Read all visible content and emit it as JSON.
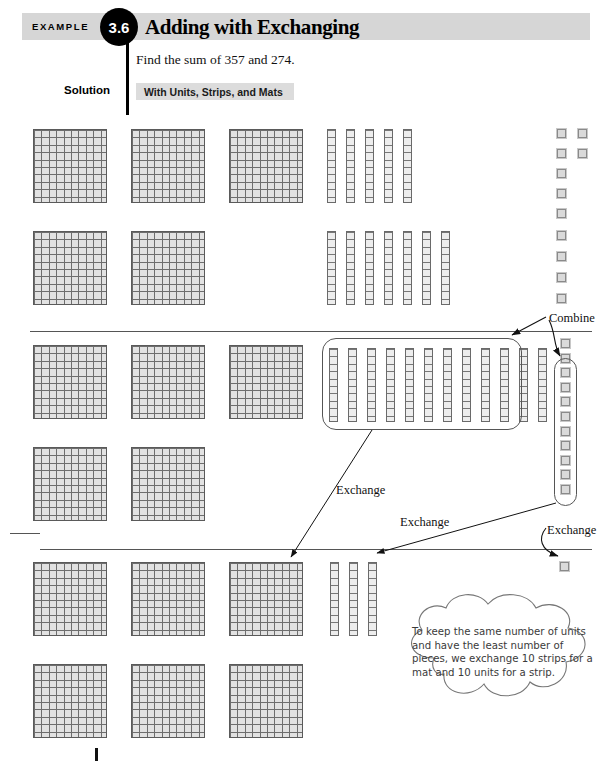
{
  "header": {
    "example_label": "EXAMPLE",
    "example_number": "3.6",
    "title": "Adding with Exchanging"
  },
  "problem": {
    "statement": "Find the sum of 357 and 274.",
    "solution_label": "Solution",
    "method_label": "With Units, Strips, and Mats"
  },
  "annotations": {
    "combine": "Combine",
    "exchange_strips": "Exchange",
    "exchange_units": "Exchange",
    "exchange_single": "Exchange"
  },
  "callout": {
    "text": "To keep the same number of units and have the least number of pieces, we exchange 10 strips for a mat and 10 units for a strip."
  },
  "colors": {
    "header_band": "#d6d6d6",
    "badge": "#000000",
    "mat_fill": "#e2e2e2",
    "mat_grid": "#6e6e6e",
    "unit_fill": "#dadada",
    "rule": "#555555"
  },
  "manipulatives": {
    "addend_one": {
      "label": "357",
      "mats": 3,
      "strips": 5,
      "units": 7
    },
    "addend_two": {
      "label": "274",
      "mats": 2,
      "strips": 7,
      "units": 4
    },
    "combined": {
      "label": "5 mats, 12 strips, 11 units",
      "mats": 5,
      "strips": 12,
      "units": 11,
      "strips_grouped": 10,
      "units_grouped": 10
    },
    "result": {
      "label": "631",
      "mats": 6,
      "strips": 3,
      "units": 1
    }
  }
}
